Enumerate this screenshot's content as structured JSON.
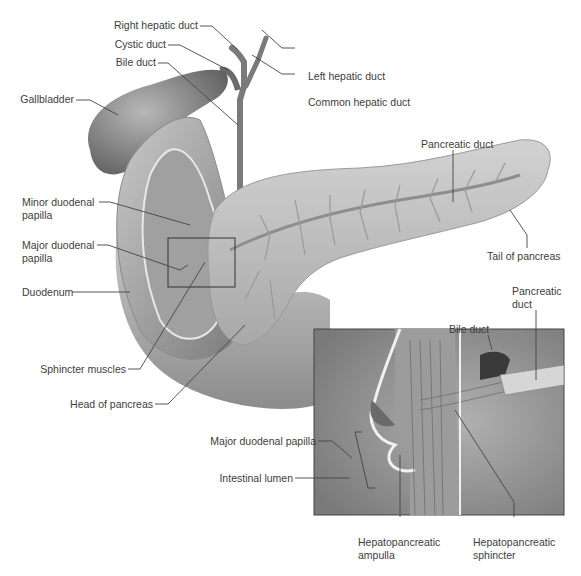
{
  "figure": {
    "colors": {
      "background": "#ffffff",
      "label_text": "#3d3d3d",
      "leader_line": "#444444",
      "organ_base": "#a6a6a6",
      "organ_shadow": "#6e6e6e",
      "pancreas": "#c4c4c4",
      "inset_bg": "#8f8f8f"
    }
  },
  "labels": {
    "right_hepatic_duct": "Right hepatic duct",
    "cystic_duct": "Cystic duct",
    "bile_duct": "Bile duct",
    "gallbladder": "Gallbladder",
    "left_hepatic_duct": "Left hepatic duct",
    "common_hepatic_duct": "Common hepatic duct",
    "pancreatic_duct": "Pancreatic duct",
    "tail_of_pancreas": "Tail of pancreas",
    "minor_duodenal_papilla_1": "Minor duodenal",
    "minor_duodenal_papilla_2": "papilla",
    "major_duodenal_papilla_1": "Major duodenal",
    "major_duodenal_papilla_2": "papilla",
    "duodenum": "Duodenum",
    "sphincter_muscles": "Sphincter muscles",
    "head_of_pancreas": "Head of pancreas"
  },
  "inset": {
    "labels": {
      "bile_duct": "Bile duct",
      "pancreatic_duct_1": "Pancreatic",
      "pancreatic_duct_2": "duct",
      "major_duodenal_papilla": "Major duodenal papilla",
      "intestinal_lumen": "Intestinal lumen",
      "hepatopancreatic_ampulla_1": "Hepatopancreatic",
      "hepatopancreatic_ampulla_2": "ampulla",
      "hepatopancreatic_sphincter_1": "Hepatopancreatic",
      "hepatopancreatic_sphincter_2": "sphincter"
    }
  }
}
